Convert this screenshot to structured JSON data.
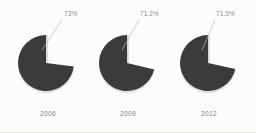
{
  "chart_data": {
    "type": "pie",
    "title": "",
    "subtitle": "",
    "xlabel": "",
    "ylabel": "",
    "legend_position": "none",
    "grid": false,
    "panels": [
      {
        "category": "2006",
        "value_label": "73%",
        "value": 73,
        "remainder": 27,
        "slices": [
          {
            "name": "share",
            "value": 73,
            "color": "#3b3b3b"
          },
          {
            "name": "gap",
            "value": 27,
            "color": "#fdfcfb"
          }
        ]
      },
      {
        "category": "2009",
        "value_label": "71.2%",
        "value": 71.2,
        "remainder": 28.8,
        "slices": [
          {
            "name": "share",
            "value": 71.2,
            "color": "#3b3b3b"
          },
          {
            "name": "gap",
            "value": 28.8,
            "color": "#fdfcfb"
          }
        ]
      },
      {
        "category": "2012",
        "value_label": "71.5%",
        "value": 71.5,
        "remainder": 28.5,
        "slices": [
          {
            "name": "share",
            "value": 71.5,
            "color": "#3b3b3b"
          },
          {
            "name": "gap",
            "value": 28.5,
            "color": "#fdfcfb"
          }
        ]
      }
    ],
    "colors": {
      "slice": "#3b3b3b",
      "background": "#fdfcfb",
      "label_text": "#8d8d8d",
      "category_text": "#7f7f7f",
      "leader_line": "#b9b7b4",
      "shadow": "#cfcdca"
    },
    "geometry": {
      "centers_x": [
        46,
        127,
        208
      ],
      "center_y": 63,
      "radius": 28,
      "start_angle_deg": 0
    },
    "labels": {
      "pct_positions": [
        {
          "x": 64,
          "y": 11
        },
        {
          "x": 140,
          "y": 11
        },
        {
          "x": 216,
          "y": 11
        }
      ],
      "year_positions": [
        {
          "x": 48,
          "y": 111
        },
        {
          "x": 128,
          "y": 111
        },
        {
          "x": 209,
          "y": 111
        }
      ],
      "leader_lines": [
        {
          "x1": 62,
          "y1": 20,
          "x2": 42,
          "y2": 50
        },
        {
          "x1": 139,
          "y1": 20,
          "x2": 122,
          "y2": 50
        },
        {
          "x1": 215,
          "y1": 20,
          "x2": 202,
          "y2": 50
        }
      ]
    }
  }
}
